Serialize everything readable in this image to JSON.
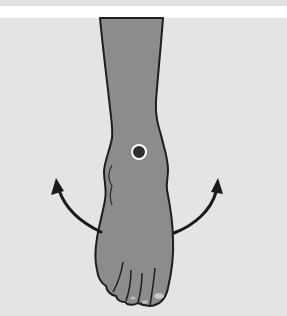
{
  "figure": {
    "title": "Foot rotation illustration",
    "marker": {
      "label": "ankle point",
      "color": "#2e2e2e",
      "ring_color": "#ffffff"
    },
    "arrows": [
      {
        "name": "rotate-left",
        "direction": "outward-left"
      },
      {
        "name": "rotate-right",
        "direction": "outward-right"
      }
    ],
    "colors": {
      "background": "#e4e4e4",
      "skin": "#8c8c8c",
      "outline": "#1e1e1e",
      "arrow": "#1a1a1a",
      "band_white": "#ffffff"
    }
  }
}
